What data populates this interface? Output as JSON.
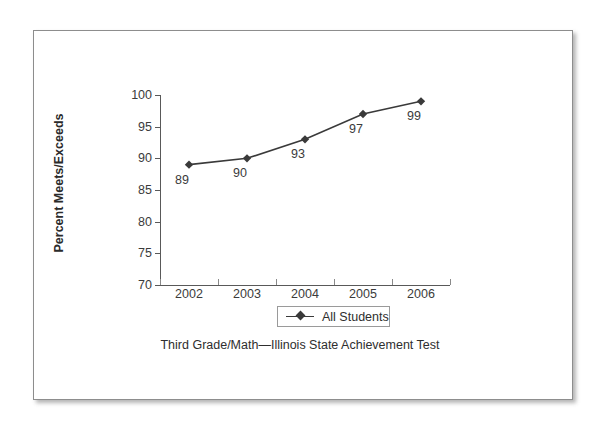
{
  "chart_data": {
    "type": "line",
    "title": "",
    "caption": "Third Grade/Math—Illinois State Achievement Test",
    "categories": [
      "2002",
      "2003",
      "2004",
      "2005",
      "2006"
    ],
    "series": [
      {
        "name": "All Students",
        "values": [
          89,
          90,
          93,
          97,
          99
        ],
        "marker": "diamond",
        "color": "#3a3a3a"
      }
    ],
    "point_labels": [
      "89",
      "90",
      "93",
      "97",
      "99"
    ],
    "xlabel": "",
    "ylabel": "Percent Meets/Exceeds",
    "ylim": [
      70,
      100
    ],
    "yticks": [
      70,
      75,
      80,
      85,
      90,
      95,
      100
    ],
    "ytick_labels": [
      "70",
      "75",
      "80",
      "85",
      "90",
      "95",
      "100"
    ],
    "xtick_labels": [
      "2002",
      "2003",
      "2004",
      "2005",
      "2006"
    ],
    "grid": false,
    "legend": {
      "position": "bottom",
      "entries": [
        "All Students"
      ]
    },
    "axis_color": "#595959",
    "text_color": "#3b3b3b"
  },
  "legend": {
    "label": "All Students"
  },
  "axis": {
    "y_title": "Percent Meets/Exceeds"
  },
  "caption": {
    "text": "Third Grade/Math—Illinois State Achievement Test"
  }
}
